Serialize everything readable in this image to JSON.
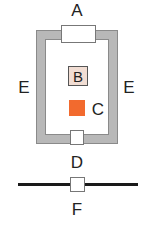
{
  "diagram": {
    "labels": {
      "A": "A",
      "B": "B",
      "C": "C",
      "D": "D",
      "E_left": "E",
      "E_right": "E",
      "F": "F"
    },
    "colors": {
      "frame": "#b8b8b8",
      "frame_edge": "#8a8a8a",
      "box_fill": "#ffffff",
      "b_fill": "#f1ddd3",
      "c_fill": "#f26a2e",
      "f_line": "#1a1a1a"
    }
  }
}
